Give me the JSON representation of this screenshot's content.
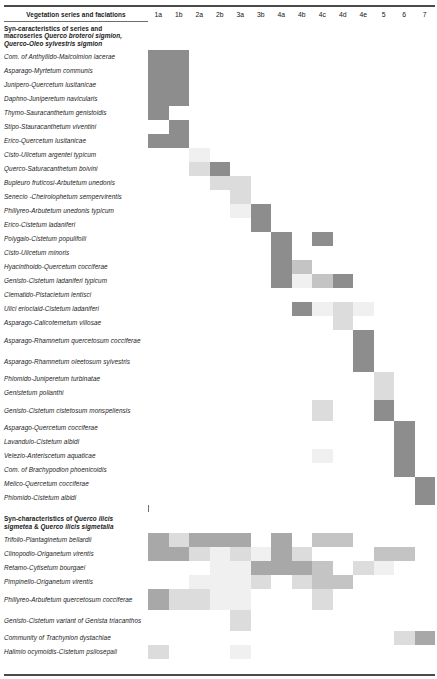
{
  "table": {
    "label_column_header": "Vegetation series and faciations",
    "column_headers": [
      "1a",
      "1b",
      "2a",
      "2b",
      "3a",
      "3b",
      "4a",
      "4b",
      "4c",
      "4d",
      "4e",
      "5",
      "6",
      "7"
    ],
    "shade_palette": {
      "s0": "#ffffff",
      "s1": "#f0f0f0",
      "s2": "#dcdcdc",
      "s3": "#c4c4c4",
      "s4": "#a8a8a8",
      "s5": "#8d8d8d"
    },
    "sections": [
      {
        "id": "section-1",
        "title": "Syn-caracteristics  of series and macroseries Querco broteroi sigmion, Querco-Oleo sylvestris sigmion",
        "title_plain_1": "Syn-caracteristics  of series and",
        "title_plain_2": "macroseries ",
        "title_italic_1": "Querco broteroi sigmion,",
        "title_italic_2": "Querco-Oleo sylvestris sigmion",
        "rows": [
          {
            "label": "Com. of Anthyllido-Malcolmion lacerae",
            "cells": [
              5,
              5,
              0,
              0,
              0,
              0,
              0,
              0,
              0,
              0,
              0,
              0,
              0,
              0
            ]
          },
          {
            "label": "Asparago-Myrtetum communis",
            "cells": [
              5,
              5,
              0,
              0,
              0,
              0,
              0,
              0,
              0,
              0,
              0,
              0,
              0,
              0
            ]
          },
          {
            "label": "Junipero-Quercetum lusitanicae",
            "cells": [
              5,
              5,
              0,
              0,
              0,
              0,
              0,
              0,
              0,
              0,
              0,
              0,
              0,
              0
            ]
          },
          {
            "label": "Daphno-Juniperetum navicularis",
            "cells": [
              5,
              5,
              0,
              0,
              0,
              0,
              0,
              0,
              0,
              0,
              0,
              0,
              0,
              0
            ]
          },
          {
            "label": "Thymo-Sauracanthetum genistoidis",
            "cells": [
              5,
              0,
              0,
              0,
              0,
              0,
              0,
              0,
              0,
              0,
              0,
              0,
              0,
              0
            ]
          },
          {
            "label": "Stipo-Stauracanthetum viventini",
            "cells": [
              0,
              5,
              0,
              0,
              0,
              0,
              0,
              0,
              0,
              0,
              0,
              0,
              0,
              0
            ]
          },
          {
            "label": "Erico-Quercetum lusitanicae",
            "cells": [
              5,
              5,
              0,
              0,
              0,
              0,
              0,
              0,
              0,
              0,
              0,
              0,
              0,
              0
            ]
          },
          {
            "label": "Cisto-Ulicetum argentei typicum",
            "cells": [
              0,
              0,
              1,
              0,
              0,
              0,
              0,
              0,
              0,
              0,
              0,
              0,
              0,
              0
            ]
          },
          {
            "label": "Querco-Saturacanthetum boivini",
            "cells": [
              0,
              0,
              2,
              5,
              0,
              0,
              0,
              0,
              0,
              0,
              0,
              0,
              0,
              0
            ]
          },
          {
            "label": "Bupleuro fruticosi-Arbutetum unedonis",
            "cells": [
              0,
              0,
              0,
              2,
              2,
              0,
              0,
              0,
              0,
              0,
              0,
              0,
              0,
              0
            ]
          },
          {
            "label": "Senecio -Cheirolophetum sempervirentis",
            "cells": [
              0,
              0,
              0,
              0,
              2,
              0,
              0,
              0,
              0,
              0,
              0,
              0,
              0,
              0
            ]
          },
          {
            "label": "Phillyreo-Arbutetum unedonis typicum",
            "cells": [
              0,
              0,
              0,
              0,
              1,
              5,
              0,
              0,
              0,
              0,
              0,
              0,
              0,
              0
            ]
          },
          {
            "label": "Erico-Cistetum ladaniferi",
            "cells": [
              0,
              0,
              0,
              0,
              0,
              5,
              0,
              0,
              0,
              0,
              0,
              0,
              0,
              0
            ]
          },
          {
            "label": "Polygalo-Cistetum populifolii",
            "cells": [
              0,
              0,
              0,
              0,
              0,
              0,
              5,
              0,
              5,
              0,
              0,
              0,
              0,
              0
            ]
          },
          {
            "label": "Cisto-Ulicetum minoris",
            "cells": [
              0,
              0,
              0,
              0,
              0,
              0,
              5,
              0,
              0,
              0,
              0,
              0,
              0,
              0
            ]
          },
          {
            "label": "Hyacinthoido-Quercetum cocciferae",
            "cells": [
              0,
              0,
              0,
              0,
              0,
              0,
              5,
              3,
              0,
              0,
              0,
              0,
              0,
              0
            ]
          },
          {
            "label": "Genisto-Cistetum ladaniferi typicum",
            "cells": [
              0,
              0,
              0,
              0,
              0,
              0,
              5,
              1,
              3,
              5,
              0,
              0,
              0,
              0
            ]
          },
          {
            "label": "Clematido-Pistacietum lentisci",
            "cells": [
              0,
              0,
              0,
              0,
              0,
              0,
              0,
              0,
              0,
              0,
              0,
              0,
              0,
              0
            ]
          },
          {
            "label": "Ulici erioclaid-Cistetum ladaniferi",
            "cells": [
              0,
              0,
              0,
              0,
              0,
              0,
              0,
              5,
              1,
              2,
              1,
              0,
              0,
              0
            ]
          },
          {
            "label": "Asparago-Calicotemetum villosae",
            "cells": [
              0,
              0,
              0,
              0,
              0,
              0,
              0,
              0,
              0,
              2,
              0,
              0,
              0,
              0
            ]
          },
          {
            "label": "Asparago-Rhamnetum quercetosum cocciferae",
            "cells": [
              0,
              0,
              0,
              0,
              0,
              0,
              0,
              0,
              0,
              0,
              5,
              0,
              0,
              0
            ]
          },
          {
            "label": "Asparago-Rhamnetum oleetosum sylvestris",
            "cells": [
              0,
              0,
              0,
              0,
              0,
              0,
              0,
              0,
              0,
              0,
              5,
              0,
              0,
              0
            ]
          },
          {
            "label": "Phlomido-Juniperetum turbinatae",
            "cells": [
              0,
              0,
              0,
              0,
              0,
              0,
              0,
              0,
              0,
              0,
              0,
              2,
              0,
              0
            ]
          },
          {
            "label": "Genistetum polianthi",
            "cells": [
              0,
              0,
              0,
              0,
              0,
              0,
              0,
              0,
              0,
              0,
              0,
              2,
              0,
              0
            ]
          },
          {
            "label": "Genisto-Cistetum cistetosum monspeliensis",
            "cells": [
              0,
              0,
              0,
              0,
              0,
              0,
              0,
              0,
              2,
              0,
              0,
              5,
              0,
              0
            ]
          },
          {
            "label": "Asparago-Quercetum cocciferae",
            "cells": [
              0,
              0,
              0,
              0,
              0,
              0,
              0,
              0,
              0,
              0,
              0,
              0,
              5,
              0
            ]
          },
          {
            "label": "Lavandulo-Cistetum albidi",
            "cells": [
              0,
              0,
              0,
              0,
              0,
              0,
              0,
              0,
              0,
              0,
              0,
              0,
              5,
              0
            ]
          },
          {
            "label": "Velezio-Anteriscetum aquaticae",
            "cells": [
              0,
              0,
              0,
              0,
              0,
              0,
              0,
              0,
              1,
              0,
              0,
              0,
              5,
              0
            ]
          },
          {
            "label": "Com. of Brachypodion phoenicoidis",
            "cells": [
              0,
              0,
              0,
              0,
              0,
              0,
              0,
              0,
              0,
              0,
              0,
              0,
              5,
              0
            ]
          },
          {
            "label": "Melico-Quercetum cocciferae",
            "cells": [
              0,
              0,
              0,
              0,
              0,
              0,
              0,
              0,
              0,
              0,
              0,
              0,
              0,
              5
            ]
          },
          {
            "label": "Phlomido-Cistetum albidi",
            "cells": [
              0,
              0,
              0,
              0,
              0,
              0,
              0,
              0,
              0,
              0,
              0,
              0,
              0,
              5
            ]
          }
        ]
      },
      {
        "id": "section-2",
        "title": "Syn-characteristics of Querco ilicis sigmetea & Querco ilicis sigmetalia",
        "title_plain_1": "Syn-characteristics of ",
        "title_italic_1": "Querco ilicis",
        "title_plain_2": "sigmetea",
        "title_plain_3": " & ",
        "title_italic_2": "Querco ilicis sigmetalia",
        "rows": [
          {
            "label": "Trifolio-Plantaginetum bellardii",
            "cells": [
              4,
              2,
              4,
              4,
              4,
              0,
              4,
              0,
              3,
              3,
              0,
              0,
              0,
              0
            ]
          },
          {
            "label": "Clinopodio-Origanetum virentis",
            "cells": [
              4,
              4,
              2,
              1,
              2,
              1,
              4,
              2,
              0,
              0,
              0,
              3,
              3,
              0
            ]
          },
          {
            "label": "Retamo-Cytisetum bourgaei",
            "cells": [
              0,
              0,
              0,
              1,
              1,
              4,
              4,
              4,
              3,
              0,
              2,
              1,
              0,
              0
            ]
          },
          {
            "label": "Pimpinello-Origanetum virentis",
            "cells": [
              0,
              0,
              1,
              1,
              1,
              2,
              0,
              2,
              3,
              3,
              0,
              0,
              0,
              0
            ]
          },
          {
            "label": "Phillyreo-Arbufetum quercetosum cocciferae",
            "cells": [
              4,
              2,
              2,
              1,
              1,
              0,
              0,
              0,
              2,
              0,
              0,
              0,
              0,
              0
            ]
          },
          {
            "label": "Genisto-Cistetum variant of Genista triacanthos",
            "cells": [
              0,
              0,
              0,
              0,
              2,
              0,
              0,
              0,
              0,
              0,
              0,
              0,
              0,
              0
            ]
          },
          {
            "label": "Community of Trachynion dystachiae",
            "cells": [
              0,
              0,
              0,
              0,
              0,
              0,
              0,
              0,
              0,
              0,
              0,
              0,
              2,
              4
            ]
          },
          {
            "label": "Halimio ocymoidis-Cistetum psilosepali",
            "cells": [
              2,
              0,
              0,
              0,
              1,
              0,
              0,
              0,
              0,
              0,
              0,
              0,
              0,
              0
            ]
          }
        ]
      }
    ]
  }
}
